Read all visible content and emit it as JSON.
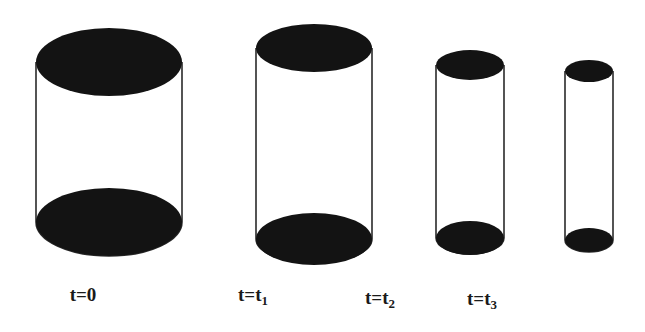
{
  "figure": {
    "background_color": "#ffffff",
    "ink_color": "#111111",
    "outline_color": "#2b2b2b",
    "width": 645,
    "height": 332
  },
  "chart_data": {
    "type": "diagram",
    "title": "",
    "xlabel": "",
    "ylabel": "",
    "categories": [
      "t=0",
      "t=t1",
      "t=t2",
      "t=t3"
    ],
    "series": [
      {
        "name": "diameter_px",
        "values": [
          146,
          117,
          68,
          47
        ]
      },
      {
        "name": "height_px",
        "values": [
          230,
          217,
          180,
          170
        ]
      }
    ],
    "cylinders": [
      {
        "id": "cylinder-1",
        "label_key": "t0",
        "center_x": 109,
        "top_center_y": 62,
        "bottom_center_y": 222,
        "rx": 73,
        "ry": 34,
        "body_height": 160
      },
      {
        "id": "cylinder-2",
        "label_key": "t1",
        "center_x": 314,
        "top_center_y": 48,
        "bottom_center_y": 239,
        "rx": 58,
        "ry": 24,
        "body_height": 191
      },
      {
        "id": "cylinder-3",
        "label_key": "t2",
        "center_x": 470,
        "top_center_y": 65,
        "bottom_center_y": 238,
        "rx": 34,
        "ry": 16,
        "body_height": 173
      },
      {
        "id": "cylinder-4",
        "label_key": "t3",
        "center_x": 589,
        "top_center_y": 71,
        "bottom_center_y": 240,
        "rx": 24,
        "ry": 12,
        "body_height": 169
      }
    ]
  },
  "labels": {
    "t0": {
      "prefix": "t=",
      "value": "0",
      "subscript": "",
      "x": 83,
      "y": 285
    },
    "t1": {
      "prefix": "t=",
      "value": "t",
      "subscript": "1",
      "x": 253,
      "y": 285
    },
    "t2": {
      "prefix": "t=",
      "value": "t",
      "subscript": "2",
      "x": 380,
      "y": 288
    },
    "t3": {
      "prefix": "t=",
      "value": "t",
      "subscript": "3",
      "x": 482,
      "y": 289
    }
  }
}
